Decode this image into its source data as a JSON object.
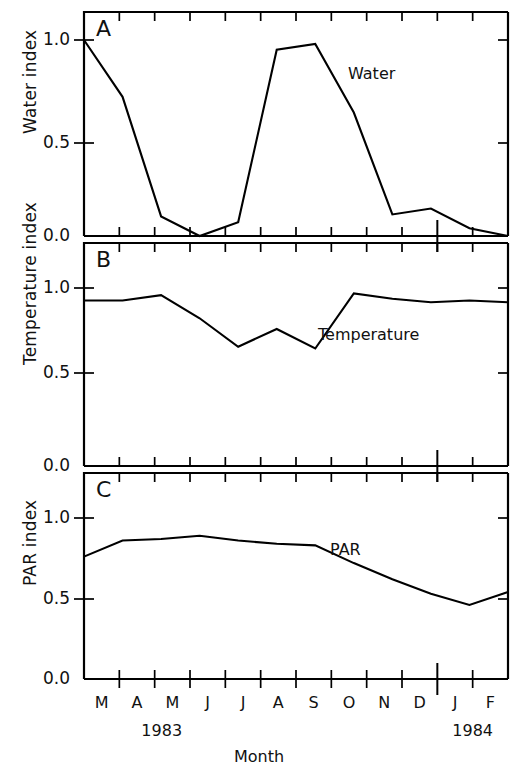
{
  "figure": {
    "x_axis_title": "Month",
    "year_left": "1983",
    "year_right": "1984",
    "months": [
      "M",
      "A",
      "M",
      "J",
      "J",
      "A",
      "S",
      "O",
      "N",
      "D",
      "J",
      "F"
    ]
  },
  "panels": [
    {
      "letter": "A",
      "y_axis_title": "Water index",
      "annotation": "Water",
      "y_ticks": [
        "1.0",
        "0.5",
        "0.0"
      ]
    },
    {
      "letter": "B",
      "y_axis_title": "Temperature index",
      "annotation": "Temperature",
      "y_ticks": [
        "1.0",
        "0.5",
        "0.0"
      ]
    },
    {
      "letter": "C",
      "y_axis_title": "PAR index",
      "annotation": "PAR",
      "y_ticks": [
        "1.0",
        "0.5",
        "0.0"
      ]
    }
  ],
  "chart_data": [
    {
      "type": "line",
      "panel": "A",
      "title": "Water",
      "xlabel": "Month",
      "ylabel": "Water index",
      "ylim": [
        0.0,
        1.0
      ],
      "yticks": [
        0.0,
        0.5,
        1.0
      ],
      "grid": false,
      "legend": "none",
      "categories": [
        "M",
        "A",
        "M",
        "J",
        "J",
        "A",
        "S",
        "O",
        "N",
        "D",
        "J",
        "F"
      ],
      "x_full": [
        "Mar 1983",
        "Apr 1983",
        "May 1983",
        "Jun 1983",
        "Jul 1983",
        "Aug 1983",
        "Sep 1983",
        "Oct 1983",
        "Nov 1983",
        "Dec 1983",
        "Jan 1984",
        "Feb 1984"
      ],
      "values": [
        1.0,
        0.71,
        0.1,
        0.0,
        0.07,
        0.95,
        0.98,
        0.63,
        0.11,
        0.14,
        0.04,
        0.0
      ]
    },
    {
      "type": "line",
      "panel": "B",
      "title": "Temperature",
      "xlabel": "Month",
      "ylabel": "Temperature index",
      "ylim": [
        0.0,
        1.0
      ],
      "yticks": [
        0.0,
        0.5,
        1.0
      ],
      "grid": false,
      "legend": "none",
      "categories": [
        "M",
        "A",
        "M",
        "J",
        "J",
        "A",
        "S",
        "O",
        "N",
        "D",
        "J",
        "F"
      ],
      "x_full": [
        "Mar 1983",
        "Apr 1983",
        "May 1983",
        "Jun 1983",
        "Jul 1983",
        "Aug 1983",
        "Sep 1983",
        "Oct 1983",
        "Nov 1983",
        "Dec 1983",
        "Jan 1984",
        "Feb 1984"
      ],
      "values": [
        0.93,
        0.93,
        0.96,
        0.83,
        0.67,
        0.77,
        0.66,
        0.97,
        0.94,
        0.92,
        0.93,
        0.92
      ]
    },
    {
      "type": "line",
      "panel": "C",
      "title": "PAR",
      "xlabel": "Month",
      "ylabel": "PAR index",
      "ylim": [
        0.0,
        1.0
      ],
      "yticks": [
        0.0,
        0.5,
        1.0
      ],
      "grid": false,
      "legend": "none",
      "categories": [
        "M",
        "A",
        "M",
        "J",
        "J",
        "A",
        "S",
        "O",
        "N",
        "D",
        "J",
        "F"
      ],
      "x_full": [
        "Mar 1983",
        "Apr 1983",
        "May 1983",
        "Jun 1983",
        "Jul 1983",
        "Aug 1983",
        "Sep 1983",
        "Oct 1983",
        "Nov 1983",
        "Dec 1983",
        "Jan 1984",
        "Feb 1984"
      ],
      "values": [
        0.76,
        0.86,
        0.87,
        0.89,
        0.86,
        0.84,
        0.83,
        0.72,
        0.62,
        0.53,
        0.46,
        0.54
      ]
    }
  ]
}
